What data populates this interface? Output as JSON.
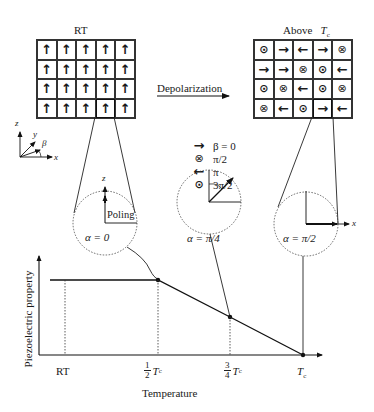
{
  "diagram": {
    "left_grid": {
      "title": "RT",
      "rows": [
        [
          "up",
          "up",
          "up",
          "up",
          "up"
        ],
        [
          "up",
          "up",
          "up",
          "up",
          "up"
        ],
        [
          "up",
          "up",
          "up",
          "up",
          "up"
        ],
        [
          "up",
          "up",
          "up",
          "up",
          "up"
        ]
      ],
      "highlighted_cell": [
        3,
        3
      ]
    },
    "right_grid": {
      "title": "Above",
      "title_suffix": "T",
      "title_sub": "c",
      "rows": [
        [
          "dot",
          "right",
          "left",
          "right",
          "cross"
        ],
        [
          "right",
          "right",
          "cross",
          "dot",
          "left"
        ],
        [
          "dot",
          "cross",
          "left",
          "dot",
          "cross"
        ],
        [
          "cross",
          "left",
          "dot",
          "right",
          "left"
        ]
      ],
      "highlighted_cell": [
        3,
        3
      ]
    },
    "transition_arrow_label": "Depolarization",
    "axes_glyph": {
      "z": "z",
      "y": "y",
      "x": "x",
      "angle": "β"
    },
    "legend": [
      {
        "icon": "right",
        "label": "β = 0"
      },
      {
        "icon": "cross",
        "label": "π/2"
      },
      {
        "icon": "left",
        "label": "π"
      },
      {
        "icon": "dot",
        "label": "3π/2"
      }
    ],
    "circles": [
      {
        "label": "α = 0",
        "extra_label": "Poling",
        "axis_label": "z"
      },
      {
        "label": "α = π/4"
      },
      {
        "label": "α = π/2",
        "axis_label": "x"
      }
    ]
  },
  "chart_data": {
    "type": "line",
    "title": "",
    "xlabel": "Temperature",
    "ylabel": "Piezoelectric property",
    "x_ticks": [
      "RT",
      "1/2 Tc",
      "3/4 Tc",
      "Tc"
    ],
    "x": [
      0,
      0.5,
      0.75,
      1.0
    ],
    "series": [
      {
        "name": "Piezoelectric property",
        "values": [
          1.0,
          1.0,
          0.5,
          0.0
        ]
      }
    ],
    "markers": [
      {
        "x": "1/2 Tc",
        "y": 1.0
      },
      {
        "x": "3/4 Tc",
        "y": 0.5
      },
      {
        "x": "Tc",
        "y": 0.0
      }
    ],
    "grid": false,
    "legend_position": "none"
  },
  "labels": {
    "rt": "RT",
    "half_num": "1",
    "half_den": "2",
    "three_q_num": "3",
    "three_q_den": "4",
    "T": "T",
    "c": "c",
    "xlabel": "Temperature",
    "ylabel": "Piezoelectric property"
  }
}
